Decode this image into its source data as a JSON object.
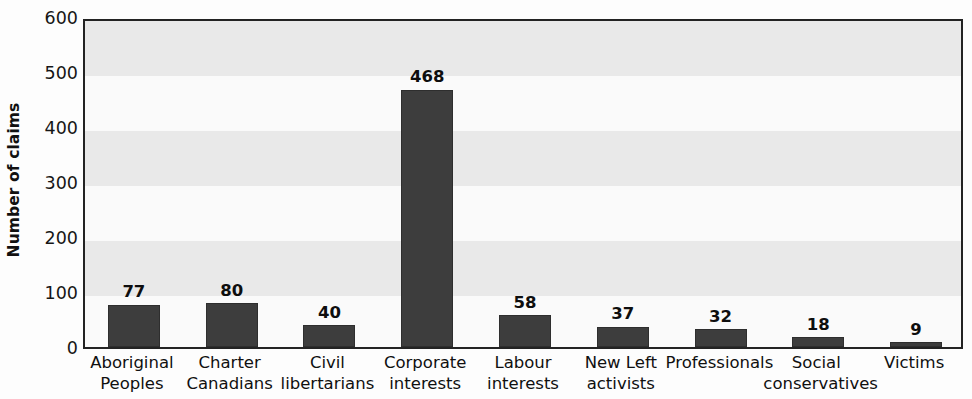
{
  "chart_data": {
    "type": "bar",
    "title": "",
    "xlabel": "",
    "ylabel": "Number of claims",
    "ylim": [
      0,
      600
    ],
    "yticks": [
      0,
      100,
      200,
      300,
      400,
      500,
      600
    ],
    "ytick_labels": [
      "0",
      "100",
      "200",
      "300",
      "400",
      "500",
      "600"
    ],
    "grid": "horizontal-alternating-bands",
    "legend": "none",
    "bar_color": "#3d3d3d",
    "plot_border_color": "#232323",
    "band_dark_color": "#e9e9e9",
    "band_light_color": "#fafafa",
    "categories": [
      "Aboriginal Peoples",
      "Charter Canadians",
      "Civil libertarians",
      "Corporate interests",
      "Labour interests",
      "New Left activists",
      "Professionals",
      "Social conservatives",
      "Victims"
    ],
    "category_lines": [
      [
        "Aboriginal",
        "Peoples"
      ],
      [
        "Charter",
        "Canadians"
      ],
      [
        "Civil",
        "libertarians"
      ],
      [
        "Corporate",
        "interests"
      ],
      [
        "Labour",
        "interests"
      ],
      [
        "New Left",
        "activists"
      ],
      [
        "Professionals",
        ""
      ],
      [
        "Social",
        "conservatives"
      ],
      [
        "Victims",
        ""
      ]
    ],
    "values": [
      77,
      80,
      40,
      468,
      58,
      37,
      32,
      18,
      9
    ],
    "value_labels": [
      "77",
      "80",
      "40",
      "468",
      "58",
      "37",
      "32",
      "18",
      "9"
    ]
  }
}
